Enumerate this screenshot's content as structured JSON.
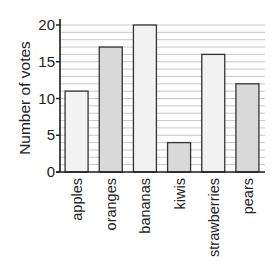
{
  "chart_data": {
    "type": "bar",
    "title": "",
    "xlabel": "",
    "ylabel": "Number of votes",
    "categories": [
      "apples",
      "oranges",
      "bananas",
      "kiwis",
      "strawberries",
      "pears"
    ],
    "values": [
      11,
      17,
      20,
      4,
      16,
      12
    ],
    "ylim": [
      0,
      20
    ],
    "yticks": [
      0,
      5,
      10,
      15,
      20
    ],
    "minor_grid_step": 1,
    "grid": true,
    "legend": null,
    "bar_colors": [
      "#f2f2f2",
      "#d9d9d9",
      "#f2f2f2",
      "#d9d9d9",
      "#f2f2f2",
      "#d9d9d9"
    ]
  },
  "colors": {
    "axis": "#1a1a1a",
    "grid": "#c8c8c8",
    "bar_border": "#333333",
    "text": "#222222"
  }
}
